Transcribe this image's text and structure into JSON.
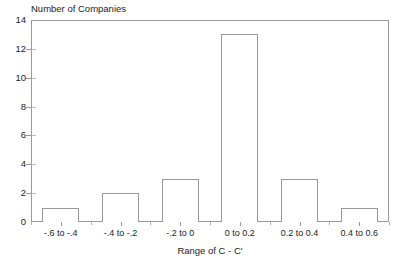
{
  "chart_data": {
    "type": "bar",
    "title": "",
    "xlabel": "Range of C - C'",
    "ylabel": "Number of Companies",
    "categories": [
      "-.6 to -.4",
      "-.4 to -.2",
      "-.2 to 0",
      "0 to 0.2",
      "0.2 to 0.4",
      "0.4 to 0.6"
    ],
    "values": [
      1,
      2,
      3,
      13,
      3,
      1
    ],
    "ylim": [
      0,
      14
    ],
    "yticks": [
      0,
      2,
      4,
      6,
      8,
      10,
      12,
      14
    ],
    "ytick_labels": [
      "0",
      "2",
      "4",
      "6",
      "8",
      "10",
      "12",
      "14"
    ],
    "grid": false,
    "legend": null,
    "bar_fill": "#ffffff",
    "bar_edge": "#9a9a9a",
    "frame_color": "#9a9a9a",
    "background": "#ffffff"
  }
}
